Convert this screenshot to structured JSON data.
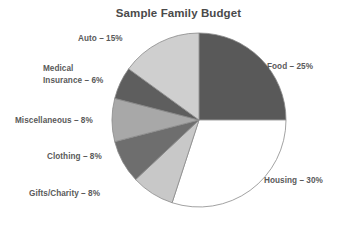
{
  "chart_data": {
    "type": "pie",
    "title": "Sample Family Budget",
    "categories": [
      "Food",
      "Housing",
      "Gifts/Charity",
      "Clothing",
      "Miscellaneous",
      "Medical Insurance",
      "Auto"
    ],
    "values": [
      25,
      30,
      8,
      8,
      8,
      6,
      15
    ],
    "unit": "%",
    "start_angle_deg": 0,
    "direction": "clockwise",
    "legend": "none",
    "grid": false,
    "slices": [
      {
        "name": "Food",
        "value": 25,
        "label": "Food – 25%",
        "color": "#595959",
        "start_deg": 0,
        "end_deg": 90,
        "label_position": "right-upper"
      },
      {
        "name": "Housing",
        "value": 30,
        "label": "Housing – 30%",
        "color": "#ffffff",
        "start_deg": 90,
        "end_deg": 198,
        "label_position": "right-lower"
      },
      {
        "name": "Gifts/Charity",
        "value": 8,
        "label": "Gifts/Charity – 8%",
        "color": "#c8c8c8",
        "start_deg": 198,
        "end_deg": 226.8,
        "label_position": "left-lower"
      },
      {
        "name": "Clothing",
        "value": 8,
        "label": "Clothing – 8%",
        "color": "#6e6e6e",
        "start_deg": 226.8,
        "end_deg": 255.6,
        "label_position": "left"
      },
      {
        "name": "Miscellaneous",
        "value": 8,
        "label": "Miscellaneous – 8%",
        "color": "#a8a8a8",
        "start_deg": 255.6,
        "end_deg": 284.4,
        "label_position": "left"
      },
      {
        "name": "Medical Insurance",
        "value": 6,
        "label_line1": "Medical",
        "label_line2": "Insurance – 6%",
        "color": "#5e5e5e",
        "start_deg": 284.4,
        "end_deg": 306,
        "label_position": "left-upper"
      },
      {
        "name": "Auto",
        "value": 15,
        "label": "Auto – 15%",
        "color": "#cfcfcf",
        "start_deg": 306,
        "end_deg": 360,
        "label_position": "top-left"
      }
    ],
    "geometry": {
      "center_x": 199,
      "center_y": 120,
      "radius": 87
    },
    "colors": {
      "outline": "#8a8a8a",
      "text": "#5a5a5a",
      "title_text": "#4a4a4a",
      "background": "#ffffff"
    }
  }
}
